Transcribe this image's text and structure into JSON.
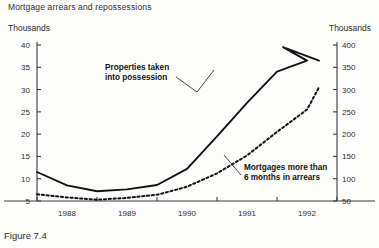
{
  "figure": {
    "title": "Mortgage arrears and repossessions",
    "caption": "Figure 7.4",
    "unit_left": "Thousands",
    "unit_right": "Thousands"
  },
  "chart_data": {
    "type": "line",
    "title": "Mortgage arrears and repossessions",
    "xlabel": "",
    "ylabel": "Thousands",
    "y2label": "Thousands",
    "grid": false,
    "legend": "annotations-on-plot",
    "xlim": [
      1987.5,
      1992.5
    ],
    "ylim": [
      5,
      40
    ],
    "y2lim": [
      50,
      400
    ],
    "yticks": [
      5,
      10,
      15,
      20,
      25,
      30,
      35,
      40
    ],
    "y2ticks": [
      50,
      100,
      150,
      200,
      250,
      300,
      350,
      400
    ],
    "xticks": [
      1988,
      1989,
      1990,
      1991,
      1992
    ],
    "xtick_labels": [
      "1988",
      "1989",
      "1990",
      "1991",
      "1992"
    ],
    "series": [
      {
        "name": "Properties taken into possession",
        "axis": "left",
        "style": "solid",
        "annotation": "Properties taken\ninto possession",
        "x": [
          1987.5,
          1988.0,
          1988.5,
          1989.0,
          1989.5,
          1990.0,
          1990.5,
          1991.0,
          1991.5,
          1992.0
        ],
        "values": [
          11.5,
          8.5,
          7.2,
          7.6,
          8.6,
          12.2,
          19.5,
          27.0,
          34.0,
          36.5
        ]
      },
      {
        "name": "Mortgages more than 6 months in arrears",
        "axis": "right",
        "style": "dotted",
        "annotation": "Mortgages more than\n6 months in arrears",
        "x": [
          1987.5,
          1988.0,
          1988.5,
          1989.0,
          1989.5,
          1990.0,
          1990.5,
          1991.0,
          1991.5,
          1992.0
        ],
        "values": [
          65,
          58,
          53,
          57,
          64,
          82,
          112,
          152,
          205,
          255
        ]
      }
    ],
    "series_left_peak": {
      "x": 1991.6,
      "value": 39.5
    },
    "series_left_end": {
      "x": 1992.2,
      "value": 36.5
    },
    "series_right_end": {
      "x": 1992.2,
      "value": 305
    }
  },
  "annotations": [
    {
      "id": "possession",
      "text_line1": "Properties taken",
      "text_line2": "into possession"
    },
    {
      "id": "arrears",
      "text_line1": "Mortgages more than",
      "text_line2": "6 months in arrears"
    }
  ]
}
